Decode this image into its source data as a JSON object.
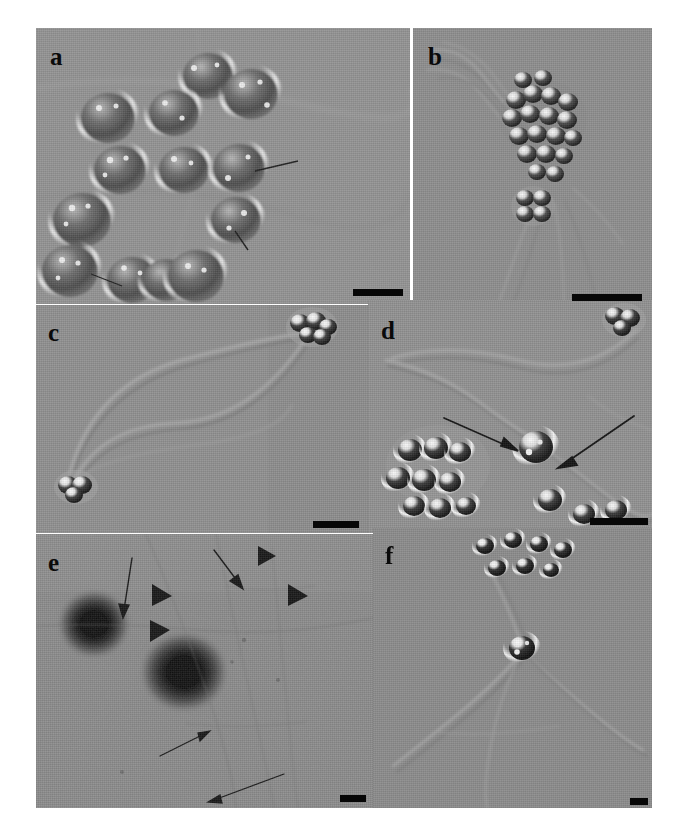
{
  "figure": {
    "kind": "multi-panel-micrograph",
    "background_color": "#ffffff",
    "panel_count": 6,
    "rows": 3,
    "columns": 2
  },
  "panels": [
    {
      "id": "a",
      "label": "a",
      "microscopy": "DIC",
      "background_color": "#8e8e8e",
      "label_color": "#0a0a0a",
      "scalebar": {
        "present": true,
        "color": "#070707"
      },
      "annotations": {
        "arrows": 2,
        "arrowheads": 0
      },
      "content": "field of ovoid algal cells with refractile granules"
    },
    {
      "id": "b",
      "label": "b",
      "microscopy": "DIC",
      "background_color": "#8d8d8d",
      "label_color": "#0a0a0a",
      "scalebar": {
        "present": true,
        "color": "#070707"
      },
      "annotations": {
        "arrows": 0,
        "arrowheads": 0
      },
      "content": "aggregated cell cluster with fibrous strands and separate tetrad"
    },
    {
      "id": "c",
      "label": "c",
      "microscopy": "DIC",
      "background_color": "#8f8f8f",
      "label_color": "#0a0a0a",
      "scalebar": {
        "present": true,
        "color": "#070707"
      },
      "annotations": {
        "arrows": 0,
        "arrowheads": 0
      },
      "content": "long looping filament connecting two cell clusters"
    },
    {
      "id": "d",
      "label": "d",
      "microscopy": "DIC",
      "background_color": "#909090",
      "label_color": "#0a0a0a",
      "scalebar": {
        "present": true,
        "color": "#070707"
      },
      "annotations": {
        "arrows": 2,
        "arrowheads": 0
      },
      "content": "cell group with arrows marking a single cell on a filament"
    },
    {
      "id": "e",
      "label": "e",
      "microscopy": "TEM",
      "background_color": "#8a8a8a",
      "label_color": "#0a0a0a",
      "scalebar": {
        "present": true,
        "color": "#070707"
      },
      "annotations": {
        "arrows": 4,
        "arrowheads": 3
      },
      "content": "electron micrograph with two dark electron-dense spots and thin fibrils"
    },
    {
      "id": "f",
      "label": "f",
      "microscopy": "DIC",
      "background_color": "#8b8b8b",
      "label_color": "#0a0a0a",
      "scalebar": {
        "present": true,
        "color": "#070707"
      },
      "annotations": {
        "arrows": 0,
        "arrowheads": 0
      },
      "content": "cells at top edge with single cell on branching filament"
    }
  ]
}
